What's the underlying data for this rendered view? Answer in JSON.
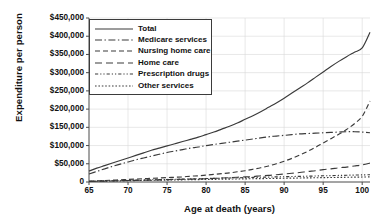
{
  "chart_data": {
    "type": "line",
    "title": "",
    "xlabel": "Age at death (years)",
    "ylabel": "Expenditure per person",
    "xlim": [
      65,
      101
    ],
    "ylim": [
      0,
      450000
    ],
    "xticks": [
      65,
      70,
      75,
      80,
      85,
      90,
      95,
      100
    ],
    "xtick_labels": [
      "65",
      "70",
      "75",
      "80",
      "85",
      "90",
      "95",
      "100"
    ],
    "yticks": [
      0,
      50000,
      100000,
      150000,
      200000,
      250000,
      300000,
      350000,
      400000,
      450000
    ],
    "ytick_labels": [
      "0",
      "$50,000",
      "$100,000",
      "$150,000",
      "$200,000",
      "$250,000",
      "$300,000",
      "$350,000",
      "$400,000",
      "$450,000"
    ],
    "grid": "both-faint",
    "legend_position": "upper-left-inside",
    "x": [
      65,
      66,
      67,
      68,
      69,
      70,
      71,
      72,
      73,
      74,
      75,
      76,
      77,
      78,
      79,
      80,
      81,
      82,
      83,
      84,
      85,
      86,
      87,
      88,
      89,
      90,
      91,
      92,
      93,
      94,
      95,
      96,
      97,
      98,
      99,
      100,
      101
    ],
    "series": [
      {
        "name": "Total",
        "dash": "solid",
        "values": [
          30000,
          38000,
          45000,
          52000,
          59000,
          66000,
          73000,
          80000,
          87000,
          93000,
          99000,
          105000,
          111000,
          117000,
          123000,
          130000,
          137000,
          145000,
          153000,
          162000,
          172000,
          182000,
          193000,
          205000,
          217000,
          230000,
          244000,
          258000,
          272000,
          287000,
          302000,
          317000,
          331000,
          344000,
          356000,
          368000,
          411000
        ]
      },
      {
        "name": "Medicare services",
        "dash": "dash-dot",
        "values": [
          22000,
          29000,
          36000,
          43000,
          49000,
          55000,
          61000,
          66000,
          71000,
          76000,
          81000,
          85000,
          89000,
          93000,
          96000,
          100000,
          103000,
          106000,
          109000,
          112000,
          115000,
          118000,
          121000,
          124000,
          126000,
          128000,
          130000,
          132000,
          133000,
          134000,
          135000,
          136000,
          137000,
          138000,
          138000,
          137000,
          135000
        ]
      },
      {
        "name": "Nursing home care",
        "dash": "dashed",
        "values": [
          2000,
          3000,
          4000,
          5000,
          6000,
          7000,
          8000,
          9000,
          10000,
          11000,
          12000,
          13000,
          14000,
          16000,
          17000,
          19000,
          21000,
          23000,
          25000,
          28000,
          31000,
          35000,
          39000,
          44000,
          50000,
          57000,
          65000,
          74000,
          84000,
          95000,
          107000,
          119000,
          131000,
          144000,
          160000,
          180000,
          222000
        ]
      },
      {
        "name": "Home care",
        "dash": "long-dash",
        "values": [
          1500,
          2000,
          2500,
          3000,
          3500,
          4000,
          4500,
          5000,
          5500,
          6000,
          6500,
          7000,
          7500,
          8000,
          8500,
          9000,
          10000,
          11000,
          12000,
          13000,
          14000,
          15000,
          17000,
          18000,
          20000,
          22000,
          24000,
          26000,
          29000,
          31000,
          34000,
          36000,
          39000,
          41000,
          44000,
          47000,
          52000
        ]
      },
      {
        "name": "Prescription drugs",
        "dash": "dash-dot-dot",
        "values": [
          2000,
          2500,
          3000,
          3500,
          4000,
          4500,
          5000,
          5500,
          6000,
          6500,
          7000,
          7500,
          8000,
          8500,
          9000,
          9500,
          10000,
          10500,
          11000,
          11500,
          12000,
          12500,
          13000,
          13500,
          14000,
          14500,
          15000,
          15500,
          16000,
          16500,
          17000,
          17500,
          18000,
          18500,
          19000,
          19500,
          20000
        ]
      },
      {
        "name": "Other services",
        "dash": "dotted",
        "values": [
          1500,
          2000,
          2400,
          2800,
          3200,
          3600,
          4000,
          4300,
          4600,
          5000,
          5300,
          5600,
          6000,
          6300,
          6600,
          7000,
          7300,
          7600,
          8000,
          8300,
          8600,
          9000,
          9300,
          9600,
          10000,
          10300,
          10600,
          11000,
          11300,
          11600,
          12000,
          12300,
          12600,
          13000,
          13300,
          13600,
          14000
        ]
      }
    ]
  },
  "legend": {
    "items": [
      {
        "label": "Total"
      },
      {
        "label": "Medicare services"
      },
      {
        "label": "Nursing home care"
      },
      {
        "label": "Home care"
      },
      {
        "label": "Prescription drugs"
      },
      {
        "label": "Other services"
      }
    ]
  },
  "colors": {
    "line": "#3a3a3a",
    "axis": "#4a4a4a",
    "grid": "#d8d8d8",
    "text": "#111111",
    "background": "#ffffff"
  }
}
